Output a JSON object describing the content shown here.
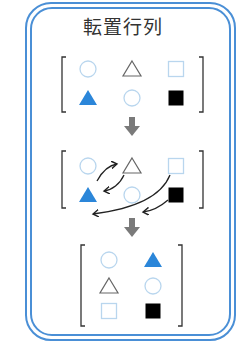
{
  "title": "転置行列",
  "colors": {
    "frame": "#4a8fd6",
    "blue_fill": "#2b86d9",
    "light_blue_outline": "#b9d6ee",
    "black_fill": "#000000",
    "gray_outline": "#666666",
    "bracket": "#333333",
    "down_arrow": "#7a7a7a",
    "curved_arrow": "#222222"
  },
  "matrices": [
    {
      "name": "original",
      "rows": [
        [
          "circle-outline",
          "triangle-outline",
          "square-outline"
        ],
        [
          "triangle-filled-blue",
          "circle-outline",
          "square-filled-black"
        ]
      ]
    },
    {
      "name": "swap-illustration",
      "rows": [
        [
          "circle-outline",
          "triangle-outline",
          "square-outline"
        ],
        [
          "triangle-filled-blue",
          "circle-outline",
          "square-filled-black"
        ]
      ],
      "swaps": [
        {
          "from": "row1-col2",
          "to": "row2-col1"
        },
        {
          "from": "row2-col1",
          "to": "row1-col2"
        },
        {
          "from": "row1-col3",
          "to": "row3-col1"
        },
        {
          "from": "row2-col3",
          "to": "row3-col2"
        }
      ]
    },
    {
      "name": "transposed",
      "rows": [
        [
          "circle-outline",
          "triangle-filled-blue"
        ],
        [
          "triangle-outline",
          "circle-outline"
        ],
        [
          "square-outline",
          "square-filled-black"
        ]
      ]
    }
  ]
}
